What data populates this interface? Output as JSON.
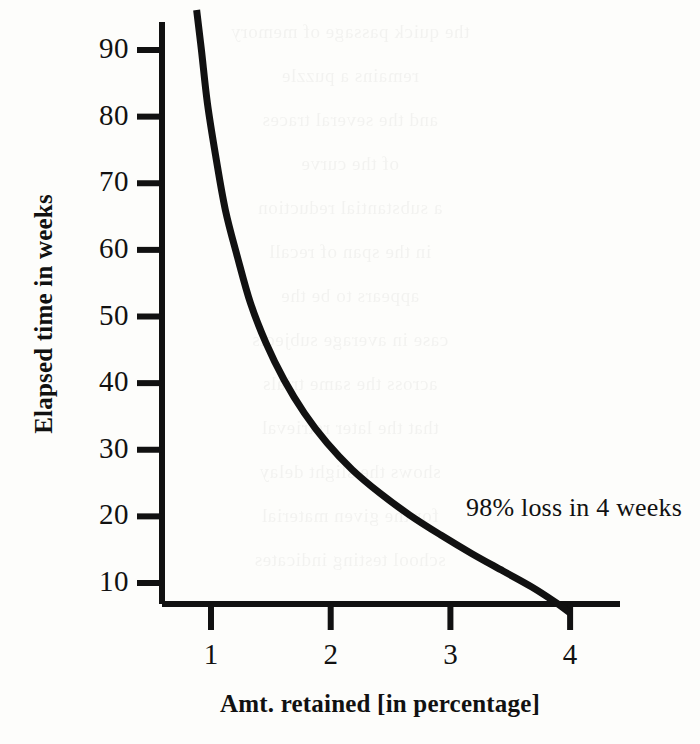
{
  "figure": {
    "background_color": "#fdfdfb",
    "ink_color": "#111111"
  },
  "chart_data": {
    "type": "line",
    "title": "",
    "subtitle": "",
    "xlabel": "Amt. retained [in percentage]",
    "ylabel": "Elapsed time in weeks",
    "xlim": [
      0,
      4.55
    ],
    "ylim": [
      0,
      96
    ],
    "grid": false,
    "legend": null,
    "x_ticks": [
      1,
      2,
      3,
      4
    ],
    "x_tick_labels": [
      "1",
      "2",
      "3",
      "4"
    ],
    "y_ticks": [
      10,
      20,
      30,
      40,
      50,
      60,
      70,
      80,
      90
    ],
    "y_tick_labels": [
      "10",
      "20",
      "30",
      "40",
      "50",
      "60",
      "70",
      "80",
      "90"
    ],
    "series": [
      {
        "name": "retention decay",
        "color": "#111111",
        "line_width": 7,
        "x": [
          0.88,
          0.92,
          0.97,
          1.04,
          1.12,
          1.22,
          1.33,
          1.46,
          1.61,
          1.78,
          1.97,
          2.18,
          2.41,
          2.66,
          2.92,
          3.18,
          3.44,
          3.68,
          3.87,
          4.0
        ],
        "y": [
          96,
          90,
          82,
          74,
          66,
          59,
          52,
          46,
          40.5,
          35.5,
          31,
          27,
          23.5,
          20.2,
          17.2,
          14.4,
          11.8,
          9.4,
          7.2,
          5.5
        ]
      }
    ],
    "annotations": [
      {
        "text": "98% loss in 4 weeks",
        "x": 3.22,
        "y": 21
      }
    ]
  },
  "bleed_through_lines": [
    "the quick passage of memory",
    "remains a puzzle",
    "and the several traces",
    "of the curve",
    "a substantial reduction",
    "in the span of recall",
    "appears to be the",
    "case in average subjects",
    "across the same trials",
    "that the later retrieval",
    "shows the slight delay",
    "for the given material",
    "school testing indicates"
  ]
}
